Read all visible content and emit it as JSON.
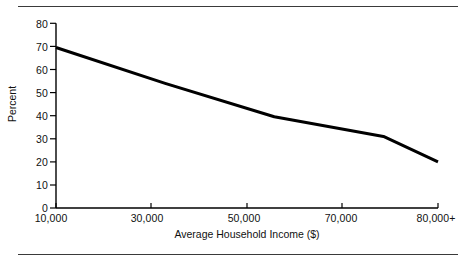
{
  "figure": {
    "background_color": "#ffffff",
    "rule_color": "#3a3a3a",
    "top_rule_name": "top-divider",
    "bottom_rule_name": "bottom-divider"
  },
  "chart_data": {
    "type": "line",
    "title": "",
    "subtitle": "",
    "xlabel": "Average Household Income ($)",
    "ylabel": "Percent",
    "x": [
      10000,
      30000,
      50000,
      70000,
      80000
    ],
    "categories": [
      "10,000",
      "30,000",
      "50,000",
      "70,000",
      "80,000+"
    ],
    "values": [
      69.5,
      54,
      39.5,
      31,
      20
    ],
    "series": [
      {
        "name": "Percent",
        "values": [
          69.5,
          54,
          39.5,
          31,
          20
        ],
        "color": "#000000",
        "line_width": 3
      }
    ],
    "xlim": [
      10000,
      80000
    ],
    "ylim": [
      0,
      80
    ],
    "x_tick_labels": [
      "10,000",
      "30,000",
      "50,000",
      "70,000",
      "80,000+"
    ],
    "y_tick_labels": [
      "0",
      "10",
      "20",
      "30",
      "40",
      "50",
      "60",
      "70",
      "80"
    ],
    "y_ticks": [
      0,
      10,
      20,
      30,
      40,
      50,
      60,
      70,
      80
    ],
    "grid": false,
    "legend": false,
    "legend_position": "none",
    "annotations": [],
    "axis_color": "#000000"
  }
}
